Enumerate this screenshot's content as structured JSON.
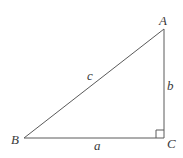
{
  "diagram": {
    "vertices": {
      "A": {
        "label": "A",
        "x": 164,
        "y": 29
      },
      "B": {
        "label": "B",
        "x": 24,
        "y": 138
      },
      "C": {
        "label": "C",
        "x": 164,
        "y": 138
      }
    },
    "sides": {
      "a": {
        "label": "a",
        "from": "B",
        "to": "C"
      },
      "b": {
        "label": "b",
        "from": "C",
        "to": "A"
      },
      "c": {
        "label": "c",
        "from": "B",
        "to": "A"
      }
    },
    "right_angle_at": "C",
    "stroke_color": "#5a5a5a",
    "label_color": "#3a3a3a",
    "background": "#ffffff"
  }
}
